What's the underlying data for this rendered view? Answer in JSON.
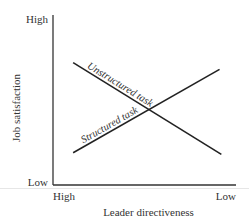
{
  "chart_data": {
    "type": "line",
    "title": "",
    "xlabel": "Leader directiveness",
    "ylabel": "Job satisfaction",
    "x_tick_labels": [
      "High",
      "Low"
    ],
    "y_tick_labels": [
      "Low",
      "High"
    ],
    "xlim": [
      0,
      1
    ],
    "ylim": [
      0,
      1
    ],
    "grid": false,
    "legend": "inline labels",
    "series": [
      {
        "name": "Unstructured task",
        "x": [
          0.11,
          0.92
        ],
        "y": [
          0.72,
          0.18
        ],
        "color": "#222222"
      },
      {
        "name": "Structured task",
        "x": [
          0.11,
          0.91
        ],
        "y": [
          0.19,
          0.68
        ],
        "color": "#222222"
      }
    ],
    "axis_color": "#333333"
  }
}
